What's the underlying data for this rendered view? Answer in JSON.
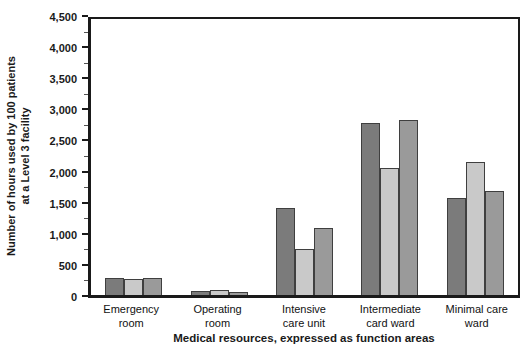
{
  "chart_data": {
    "type": "bar",
    "title": "",
    "categories": [
      "Emergency room",
      "Operating room",
      "Intensive care unit",
      "Intermediate card ward",
      "Minimal care ward"
    ],
    "categories_wrapped": [
      [
        "Emergency",
        "room"
      ],
      [
        "Operating",
        "room"
      ],
      [
        "Intensive",
        "care unit"
      ],
      [
        "Intermediate",
        "card ward"
      ],
      [
        "Minimal care",
        "ward"
      ]
    ],
    "series": [
      {
        "name": "MCO",
        "color": "#7b7b7b",
        "values": [
          270,
          60,
          1420,
          2800,
          1575
        ]
      },
      {
        "name": "OIF",
        "color": "#c9c9c9",
        "values": [
          265,
          75,
          750,
          2070,
          2175
        ]
      },
      {
        "name": "HUMRO",
        "color": "#9a9a9a",
        "values": [
          270,
          50,
          1090,
          2850,
          1690
        ]
      }
    ],
    "xlabel": "Medical resources, expressed as function areas",
    "ylabel": "Number of hours used by 100 patients at a Level 3 facility",
    "ylabel_lines": [
      "Number of hours used by 100 patients",
      "at a Level 3 facility"
    ],
    "ylim": [
      0,
      4500
    ],
    "ytick_step": 500,
    "ytick_minor_step": 250,
    "ytick_labels": [
      "0",
      "500",
      "1,000",
      "1,500",
      "2,000",
      "2,500",
      "3,000",
      "3,500",
      "4,000",
      "4,500"
    ],
    "grid": false,
    "legend_position": "top-right-inside",
    "legend": [
      "MCO",
      "OIF",
      "HUMRO"
    ]
  },
  "colors": {
    "axis": "#1a1a1a",
    "background": "#ffffff",
    "bar_border": "#3f3f3f"
  }
}
